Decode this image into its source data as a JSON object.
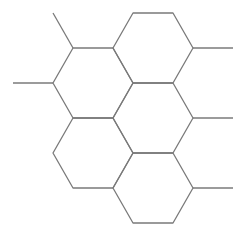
{
  "diagram": {
    "type": "hexagonal-grid",
    "stroke_color": "#7a7a7a",
    "background": "#ffffff",
    "hexagons": [
      {
        "id": "top",
        "points": "133,13 173,13 193,48 173,83 133,83 113,48"
      },
      {
        "id": "left-top",
        "points": "73,48 113,48 133,83 113,118 73,118 53,83"
      },
      {
        "id": "center",
        "points": "133,83 173,83 193,118 173,153 133,153 113,118"
      },
      {
        "id": "left-bottom",
        "points": "73,118 113,118 133,153 113,188 73,188 53,153"
      },
      {
        "id": "bottom",
        "points": "133,153 173,153 193,188 173,223 133,223 113,188"
      }
    ],
    "stubs": [
      {
        "id": "stub-top-left",
        "x1": 73,
        "y1": 48,
        "x2": 53,
        "y2": 13
      },
      {
        "id": "stub-left",
        "x1": 53,
        "y1": 83,
        "x2": 13,
        "y2": 83
      },
      {
        "id": "stub-right-top",
        "x1": 193,
        "y1": 48,
        "x2": 233,
        "y2": 48
      },
      {
        "id": "stub-right-middle",
        "x1": 193,
        "y1": 118,
        "x2": 233,
        "y2": 118
      },
      {
        "id": "stub-right-bottom",
        "x1": 193,
        "y1": 188,
        "x2": 233,
        "y2": 188
      }
    ]
  }
}
